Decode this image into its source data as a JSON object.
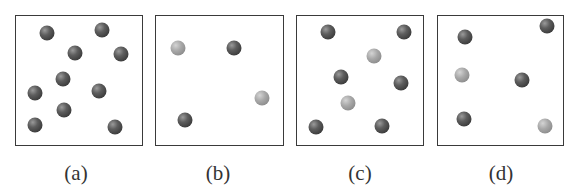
{
  "panels": [
    {
      "id": "a",
      "label": "(a)",
      "box": {
        "left": 15,
        "width": 128
      },
      "label_x": 76,
      "particles": [
        {
          "x": 47,
          "y": 33,
          "type": "dark"
        },
        {
          "x": 102,
          "y": 30,
          "type": "dark"
        },
        {
          "x": 75,
          "y": 53,
          "type": "dark"
        },
        {
          "x": 121,
          "y": 54,
          "type": "dark"
        },
        {
          "x": 63,
          "y": 79,
          "type": "dark"
        },
        {
          "x": 35,
          "y": 93,
          "type": "dark"
        },
        {
          "x": 99,
          "y": 91,
          "type": "dark"
        },
        {
          "x": 64,
          "y": 110,
          "type": "dark"
        },
        {
          "x": 35,
          "y": 125,
          "type": "dark"
        },
        {
          "x": 115,
          "y": 127,
          "type": "dark"
        }
      ]
    },
    {
      "id": "b",
      "label": "(b)",
      "box": {
        "left": 155,
        "width": 129
      },
      "label_x": 218,
      "particles": [
        {
          "x": 178,
          "y": 48,
          "type": "light"
        },
        {
          "x": 234,
          "y": 48,
          "type": "dark"
        },
        {
          "x": 262,
          "y": 98,
          "type": "light"
        },
        {
          "x": 185,
          "y": 120,
          "type": "dark"
        }
      ]
    },
    {
      "id": "c",
      "label": "(c)",
      "box": {
        "left": 296,
        "width": 128
      },
      "label_x": 360,
      "particles": [
        {
          "x": 328,
          "y": 32,
          "type": "dark"
        },
        {
          "x": 404,
          "y": 32,
          "type": "dark"
        },
        {
          "x": 374,
          "y": 56,
          "type": "light"
        },
        {
          "x": 341,
          "y": 77,
          "type": "dark"
        },
        {
          "x": 401,
          "y": 83,
          "type": "dark"
        },
        {
          "x": 348,
          "y": 103,
          "type": "light"
        },
        {
          "x": 316,
          "y": 127,
          "type": "dark"
        },
        {
          "x": 382,
          "y": 126,
          "type": "dark"
        }
      ]
    },
    {
      "id": "d",
      "label": "(d)",
      "box": {
        "left": 437,
        "width": 127
      },
      "label_x": 501,
      "particles": [
        {
          "x": 465,
          "y": 37,
          "type": "dark"
        },
        {
          "x": 547,
          "y": 26,
          "type": "dark"
        },
        {
          "x": 462,
          "y": 75,
          "type": "light"
        },
        {
          "x": 522,
          "y": 80,
          "type": "dark"
        },
        {
          "x": 464,
          "y": 119,
          "type": "dark"
        },
        {
          "x": 545,
          "y": 126,
          "type": "light"
        }
      ]
    }
  ],
  "colors": {
    "dark_particle": "#4a4a4a",
    "light_particle": "#a0a0a0",
    "border": "#3a3a3a",
    "label": "#333333"
  }
}
